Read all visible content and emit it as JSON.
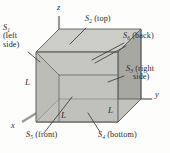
{
  "figure": {
    "type": "3d-cube-gaussian-surface",
    "title": "",
    "colors": {
      "face_front": "#b9b9b4",
      "face_top": "#c9c9c4",
      "face_right": "#a3a39e",
      "face_interior": "#c6c6c1",
      "outline": "#5a5a56",
      "leader": "#3a3a38",
      "axis": "#8c8c88",
      "text": "#2a2a2a",
      "background": "#fdfdfc"
    },
    "axes": [
      {
        "name": "z-axis-label",
        "label": "z",
        "x": 63,
        "y": 7
      },
      {
        "name": "y-axis-label",
        "label": "y",
        "x": 157,
        "y": 92
      },
      {
        "name": "x-axis-label",
        "label": "x",
        "x": 12,
        "y": 127
      }
    ],
    "surfaces": [
      {
        "id": "S1",
        "name": "surface-s1-left",
        "symbol": "S",
        "sub": "1",
        "desc": "(left side)",
        "line1": "(left",
        "line2": "side)",
        "x": 4,
        "y": 28
      },
      {
        "id": "S2",
        "name": "surface-s2-top",
        "symbol": "S",
        "sub": "2",
        "desc": "(top)",
        "x": 86,
        "y": 19
      },
      {
        "id": "S6",
        "name": "surface-s6-back",
        "symbol": "S",
        "sub": "6",
        "desc": "(back)",
        "x": 124,
        "y": 36
      },
      {
        "id": "S3",
        "name": "surface-s3-right",
        "symbol": "S",
        "sub": "3",
        "desc": "(right side)",
        "line1": "(right",
        "line2": "side)",
        "x": 126,
        "y": 68
      },
      {
        "id": "S5",
        "name": "surface-s5-front",
        "symbol": "S",
        "sub": "5",
        "desc": "(front)",
        "x": 27,
        "y": 135
      },
      {
        "id": "S4",
        "name": "surface-s4-bottom",
        "symbol": "S",
        "sub": "4",
        "desc": "(bottom)",
        "x": 99,
        "y": 135
      }
    ],
    "lengths": [
      {
        "name": "edge-length-left",
        "label": "L",
        "x": 26,
        "y": 81
      },
      {
        "name": "edge-length-front",
        "label": "L",
        "x": 62,
        "y": 114
      },
      {
        "name": "edge-length-right",
        "label": "L",
        "x": 109,
        "y": 109
      }
    ]
  }
}
